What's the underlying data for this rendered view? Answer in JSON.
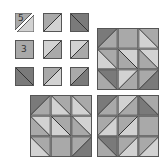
{
  "colors": {
    "dark": "#7a7a7a",
    "mid": "#a9a9a9",
    "light": "#d2d2d2",
    "pale": "#e6e6e6",
    "stroke": "#333333",
    "border": "#555555"
  },
  "pieces": [
    {
      "id": 1,
      "row": 0,
      "col": 0,
      "diag": "/",
      "a": "mid",
      "b": "light",
      "label": "5",
      "split": true
    },
    {
      "id": 2,
      "row": 0,
      "col": 1,
      "diag": "/",
      "a": "mid",
      "b": "light",
      "label": ""
    },
    {
      "id": 3,
      "row": 0,
      "col": 2,
      "diag": "\\",
      "a": "dark",
      "b": "dark",
      "label": ""
    },
    {
      "id": 4,
      "row": 1,
      "col": 0,
      "diag": "none",
      "a": "mid",
      "b": "mid",
      "label": "3"
    },
    {
      "id": 5,
      "row": 1,
      "col": 1,
      "diag": "/",
      "a": "light",
      "b": "mid",
      "label": ""
    },
    {
      "id": 6,
      "row": 1,
      "col": 2,
      "diag": "/",
      "a": "light",
      "b": "mid",
      "label": ""
    },
    {
      "id": 7,
      "row": 2,
      "col": 0,
      "diag": "\\",
      "a": "dark",
      "b": "dark",
      "label": ""
    },
    {
      "id": 8,
      "row": 2,
      "col": 1,
      "diag": "/",
      "a": "mid",
      "b": "light",
      "label": ""
    },
    {
      "id": 9,
      "row": 2,
      "col": 2,
      "diag": "/",
      "a": "mid",
      "b": "dark",
      "label": ""
    }
  ],
  "boards": [
    {
      "name": "top-right",
      "x": 97,
      "y": 28,
      "cells": [
        [
          {
            "diag": "/",
            "tl": "dark",
            "br": "mid"
          },
          {
            "diag": "none",
            "tl": "mid",
            "br": "mid"
          },
          {
            "diag": "\\",
            "tl": "mid",
            "br": "light"
          }
        ],
        [
          {
            "diag": "\\",
            "tl": "mid",
            "br": "light"
          },
          {
            "diag": "\\",
            "tl": "light",
            "br": "mid"
          },
          {
            "diag": "\\",
            "tl": "light",
            "br": "mid"
          }
        ],
        [
          {
            "diag": "\\",
            "tl": "dark",
            "br": "mid"
          },
          {
            "diag": "/",
            "tl": "light",
            "br": "mid"
          },
          {
            "diag": "/",
            "tl": "mid",
            "br": "dark"
          }
        ]
      ]
    },
    {
      "name": "bottom-left",
      "x": 30,
      "y": 95,
      "cells": [
        [
          {
            "diag": "/",
            "tl": "dark",
            "br": "mid"
          },
          {
            "diag": "\\",
            "tl": "mid",
            "br": "light"
          },
          {
            "diag": "\\",
            "tl": "mid",
            "br": "light"
          }
        ],
        [
          {
            "diag": "\\",
            "tl": "light",
            "br": "mid"
          },
          {
            "diag": "\\",
            "tl": "mid",
            "br": "light"
          },
          {
            "diag": "\\",
            "tl": "light",
            "br": "mid"
          }
        ],
        [
          {
            "diag": "\\",
            "tl": "mid",
            "br": "light"
          },
          {
            "diag": "none",
            "tl": "mid",
            "br": "mid"
          },
          {
            "diag": "/",
            "tl": "mid",
            "br": "dark"
          }
        ]
      ]
    },
    {
      "name": "bottom-right",
      "x": 97,
      "y": 95,
      "cells": [
        [
          {
            "diag": "/",
            "tl": "dark",
            "br": "mid"
          },
          {
            "diag": "/",
            "tl": "light",
            "br": "mid"
          },
          {
            "diag": "\\",
            "tl": "mid",
            "br": "dark"
          }
        ],
        [
          {
            "diag": "/",
            "tl": "mid",
            "br": "light"
          },
          {
            "diag": "/",
            "tl": "mid",
            "br": "light"
          },
          {
            "diag": "none",
            "tl": "mid",
            "br": "mid"
          }
        ],
        [
          {
            "diag": "\\",
            "tl": "dark",
            "br": "mid"
          },
          {
            "diag": "/",
            "tl": "mid",
            "br": "light"
          },
          {
            "diag": "/",
            "tl": "mid",
            "br": "light"
          }
        ]
      ]
    }
  ]
}
